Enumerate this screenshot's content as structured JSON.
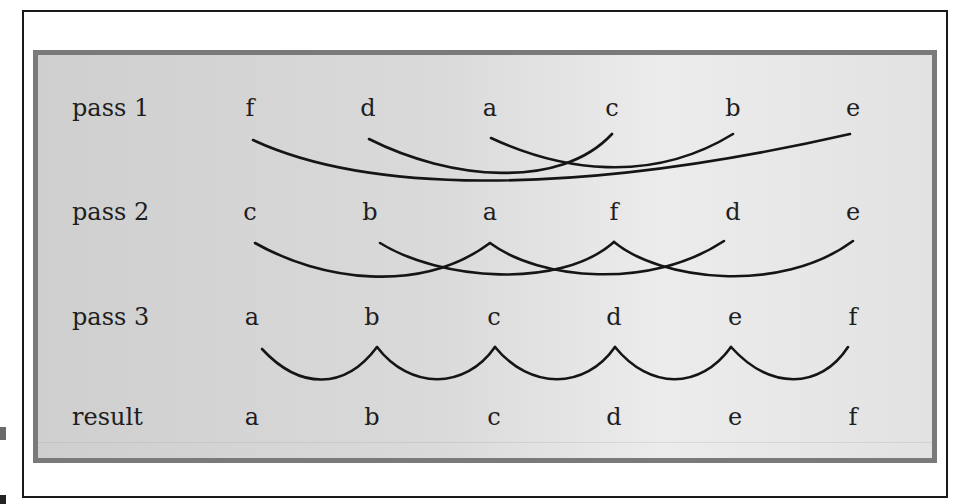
{
  "figure": {
    "rows": [
      {
        "label": "pass 1",
        "letters": [
          "f",
          "d",
          "a",
          "c",
          "b",
          "e"
        ]
      },
      {
        "label": "pass 2",
        "letters": [
          "c",
          "b",
          "a",
          "f",
          "d",
          "e"
        ]
      },
      {
        "label": "pass 3",
        "letters": [
          "a",
          "b",
          "c",
          "d",
          "e",
          "f"
        ]
      },
      {
        "label": "result",
        "letters": [
          "a",
          "b",
          "c",
          "d",
          "e",
          "f"
        ]
      }
    ],
    "arcs": {
      "pass1_gap": 3,
      "pass2_gap": 2,
      "pass3_gap": 1
    },
    "colors": {
      "panel_border": "#7a7a7a",
      "panel_fill": "#d8d8d8",
      "frame": "#1a1a1a",
      "ink": "#1e1e1e"
    }
  }
}
